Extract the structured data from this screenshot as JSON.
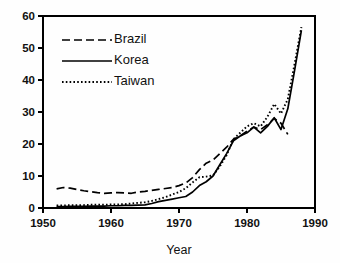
{
  "chart_data": {
    "type": "line",
    "title": "",
    "subtitle": "",
    "xlabel": "Year",
    "ylabel": "",
    "xlim": [
      1950,
      1990
    ],
    "ylim": [
      0,
      60
    ],
    "xticks": [
      1950,
      1960,
      1970,
      1980,
      1990
    ],
    "yticks": [
      0,
      10,
      20,
      30,
      40,
      50,
      60
    ],
    "grid": false,
    "legend_position": "top-left",
    "frame": "box",
    "series": [
      {
        "name": "Brazil",
        "style": "dashed",
        "x": [
          1952,
          1953,
          1954,
          1955,
          1956,
          1957,
          1958,
          1959,
          1960,
          1961,
          1962,
          1963,
          1964,
          1965,
          1966,
          1967,
          1968,
          1969,
          1970,
          1971,
          1972,
          1973,
          1974,
          1975,
          1976,
          1977,
          1978,
          1979,
          1980,
          1981,
          1982,
          1983,
          1984,
          1985,
          1986
        ],
        "values": [
          6.0,
          6.4,
          6.2,
          5.8,
          5.4,
          5.1,
          4.8,
          4.6,
          4.7,
          4.8,
          4.7,
          4.6,
          5.0,
          5.2,
          5.5,
          5.8,
          6.1,
          6.4,
          7.0,
          7.8,
          9.5,
          12.0,
          14.0,
          15.0,
          17.0,
          19.0,
          21.5,
          22.5,
          24.0,
          25.3,
          24.5,
          26.0,
          28.0,
          26.5,
          23.0
        ]
      },
      {
        "name": "Korea",
        "style": "solid",
        "x": [
          1952,
          1953,
          1954,
          1955,
          1956,
          1957,
          1958,
          1959,
          1960,
          1961,
          1962,
          1963,
          1964,
          1965,
          1966,
          1967,
          1968,
          1969,
          1970,
          1971,
          1972,
          1973,
          1974,
          1975,
          1976,
          1977,
          1978,
          1979,
          1980,
          1981,
          1982,
          1983,
          1984,
          1985,
          1986,
          1987,
          1988
        ],
        "values": [
          0.4,
          0.4,
          0.5,
          0.5,
          0.5,
          0.6,
          0.6,
          0.6,
          0.7,
          0.7,
          0.8,
          0.8,
          0.9,
          1.0,
          1.4,
          2.0,
          2.4,
          2.8,
          3.2,
          3.6,
          5.0,
          7.0,
          8.2,
          10.0,
          13.5,
          17.0,
          21.0,
          22.5,
          23.5,
          25.3,
          23.5,
          25.5,
          28.2,
          24.5,
          31.0,
          43.0,
          55.5
        ]
      },
      {
        "name": "Taiwan",
        "style": "dotted",
        "x": [
          1952,
          1953,
          1954,
          1955,
          1956,
          1957,
          1958,
          1959,
          1960,
          1961,
          1962,
          1963,
          1964,
          1965,
          1966,
          1967,
          1968,
          1969,
          1970,
          1971,
          1972,
          1973,
          1974,
          1975,
          1976,
          1977,
          1978,
          1979,
          1980,
          1981,
          1982,
          1983,
          1984,
          1985,
          1986,
          1987,
          1988
        ],
        "values": [
          0.8,
          0.8,
          0.9,
          0.9,
          0.9,
          1.0,
          1.0,
          1.0,
          1.1,
          1.1,
          1.2,
          1.4,
          1.6,
          1.8,
          2.2,
          2.8,
          3.4,
          4.2,
          5.0,
          6.2,
          8.0,
          9.6,
          9.8,
          10.2,
          13.0,
          16.5,
          21.5,
          23.5,
          25.5,
          26.5,
          25.5,
          28.5,
          32.5,
          29.5,
          34.0,
          45.0,
          56.5
        ]
      }
    ]
  },
  "legend": {
    "items": [
      {
        "label": "Brazil",
        "style": "dashed"
      },
      {
        "label": "Korea",
        "style": "solid"
      },
      {
        "label": "Taiwan",
        "style": "dotted"
      }
    ]
  },
  "colors": {
    "ink": "#000000",
    "background": "#fefefe",
    "text": "#111111"
  }
}
